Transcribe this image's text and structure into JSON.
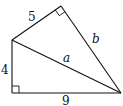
{
  "diagram": {
    "type": "geometry",
    "vertices": {
      "A": [
        12,
        40
      ],
      "B": [
        12,
        93
      ],
      "C": [
        121,
        93
      ],
      "D": [
        61,
        6
      ]
    },
    "labels": {
      "side_AD": "5",
      "side_AB": "4",
      "side_BC": "9",
      "side_AC": "a",
      "side_DC": "b"
    },
    "right_angles": [
      "B",
      "D"
    ]
  }
}
